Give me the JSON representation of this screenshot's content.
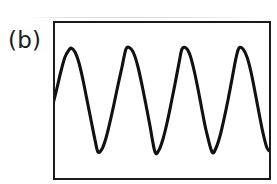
{
  "figure": {
    "panel_label": "(b)",
    "frame": {
      "x": 53,
      "y": 21,
      "width": 218,
      "height": 159,
      "border_color": "#1a1a1a",
      "border_width": 2,
      "background": "#ffffff"
    },
    "curve_color": "#111111",
    "curve_width": 3.1,
    "page_background": "#ffffff"
  },
  "chart_data": {
    "type": "line",
    "title": "",
    "subtitle": "",
    "xlabel": "",
    "ylabel": "",
    "annotations": [
      "(b)"
    ],
    "legend": [],
    "legend_position": "none",
    "grid": false,
    "axis_ticks": [],
    "xlim": [
      0,
      218
    ],
    "ylim": [
      0,
      159
    ],
    "waveform": {
      "shape": "sinusoid",
      "cycles_visible": 4,
      "period_px": 56,
      "peak_y_px": 48,
      "trough_y_px": 152,
      "midline_y_px": 100,
      "amplitude_px": 52,
      "peaks_x_px": [
        71,
        126,
        182,
        239
      ],
      "troughs_x_px": [
        98,
        155,
        212
      ],
      "start_clipped_left": true,
      "end_clipped_right": true
    },
    "series": [
      {
        "name": "oscillation",
        "x": [
          53,
          57,
          61,
          65,
          69,
          71,
          75,
          79,
          83,
          87,
          91,
          95,
          98,
          102,
          106,
          110,
          114,
          118,
          122,
          126,
          130,
          134,
          138,
          142,
          146,
          150,
          155,
          159,
          163,
          167,
          171,
          175,
          179,
          182,
          186,
          190,
          194,
          198,
          202,
          206,
          212,
          216,
          220,
          224,
          228,
          232,
          236,
          239,
          243,
          247,
          251,
          255,
          259,
          263,
          267,
          271
        ],
        "y": [
          104,
          88,
          71,
          57,
          50,
          48,
          52,
          63,
          80,
          100,
          120,
          140,
          152,
          149,
          138,
          122,
          104,
          85,
          67,
          49,
          48,
          54,
          67,
          85,
          105,
          126,
          152,
          150,
          139,
          123,
          104,
          84,
          63,
          49,
          48,
          55,
          70,
          89,
          110,
          130,
          152,
          148,
          136,
          119,
          100,
          79,
          58,
          48,
          49,
          57,
          72,
          92,
          113,
          133,
          148,
          152
        ]
      }
    ]
  }
}
